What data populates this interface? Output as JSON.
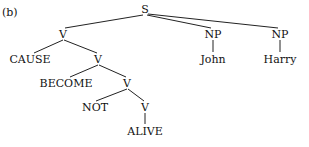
{
  "figure_label": "(b)",
  "tree": {
    "nodes": [
      {
        "id": "S",
        "label": "S",
        "x": 145,
        "y": 12
      },
      {
        "id": "V1",
        "label": "V",
        "x": 63,
        "y": 37
      },
      {
        "id": "CAUSE",
        "label": "CAUSE",
        "x": 30,
        "y": 62
      },
      {
        "id": "V2",
        "label": "V",
        "x": 98,
        "y": 62
      },
      {
        "id": "BECOME",
        "label": "BECOME",
        "x": 66,
        "y": 86
      },
      {
        "id": "V3",
        "label": "V",
        "x": 127,
        "y": 86
      },
      {
        "id": "NOT",
        "label": "NOT",
        "x": 95,
        "y": 110
      },
      {
        "id": "V4",
        "label": "V",
        "x": 145,
        "y": 110
      },
      {
        "id": "ALIVE",
        "label": "ALIVE",
        "x": 145,
        "y": 134
      },
      {
        "id": "NP1",
        "label": "NP",
        "x": 213,
        "y": 37
      },
      {
        "id": "John",
        "label": "John",
        "x": 213,
        "y": 62
      },
      {
        "id": "NP2",
        "label": "NP",
        "x": 280,
        "y": 37
      },
      {
        "id": "Harry",
        "label": "Harry",
        "x": 280,
        "y": 62
      }
    ],
    "edges": [
      [
        "S",
        "V1"
      ],
      [
        "S",
        "NP1"
      ],
      [
        "S",
        "NP2"
      ],
      [
        "V1",
        "CAUSE"
      ],
      [
        "V1",
        "V2"
      ],
      [
        "V2",
        "BECOME"
      ],
      [
        "V2",
        "V3"
      ],
      [
        "V3",
        "NOT"
      ],
      [
        "V3",
        "V4"
      ],
      [
        "V4",
        "ALIVE"
      ],
      [
        "NP1",
        "John"
      ],
      [
        "NP2",
        "Harry"
      ]
    ]
  }
}
